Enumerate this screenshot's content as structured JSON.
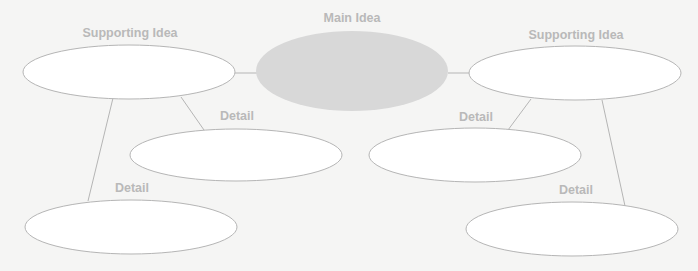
{
  "diagram": {
    "type": "concept-map",
    "colors": {
      "background": "#f5f5f4",
      "main_fill": "#d8d8d8",
      "node_fill": "#ffffff",
      "stroke": "#b5b5b5",
      "label": "#b9b9b9"
    },
    "main": {
      "label": "Main Idea"
    },
    "left_support": {
      "label": "Supporting Idea"
    },
    "right_support": {
      "label": "Supporting Idea"
    },
    "left_detail_1": {
      "label": "Detail"
    },
    "left_detail_2": {
      "label": "Detail"
    },
    "right_detail_1": {
      "label": "Detail"
    },
    "right_detail_2": {
      "label": "Detail"
    }
  }
}
